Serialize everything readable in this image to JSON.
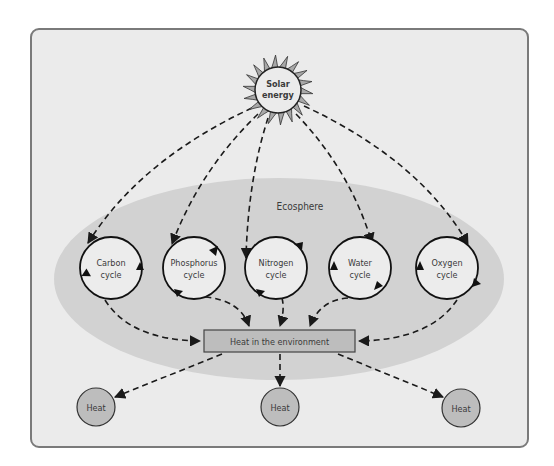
{
  "diagram": {
    "source": {
      "label_line1": "Solar",
      "label_line2": "energy"
    },
    "region": {
      "label": "Ecosphere"
    },
    "cycles": [
      {
        "line1": "Carbon",
        "line2": "cycle"
      },
      {
        "line1": "Phosphorus",
        "line2": "cycle"
      },
      {
        "line1": "Nitrogen",
        "line2": "cycle"
      },
      {
        "line1": "Water",
        "line2": "cycle"
      },
      {
        "line1": "Oxygen",
        "line2": "cycle"
      }
    ],
    "sink": {
      "label": "Heat in the environment"
    },
    "outputs": [
      {
        "label": "Heat"
      },
      {
        "label": "Heat"
      },
      {
        "label": "Heat"
      }
    ],
    "colors": {
      "frame_bg": "#ebebeb",
      "ecosphere": "#d2d2d2",
      "cycle_fill": "#ececec",
      "sun_rays": "#a8a8a8",
      "sink_fill": "#bdbdbd",
      "heat_fill": "#bdbdbd",
      "line": "#1a1a1a"
    }
  }
}
